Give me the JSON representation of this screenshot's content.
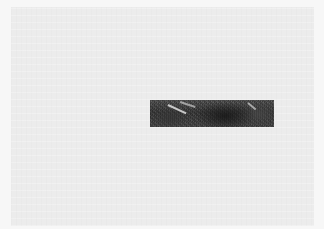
{
  "image": {
    "description": "Light gray page with a single dark grayscale textured photo strip",
    "colors": {
      "frame": "#f7f7f7",
      "background": "#ececec",
      "strip_base": "#454545"
    },
    "strip": {
      "x": 139,
      "y": 93,
      "width": 124,
      "height": 27
    }
  }
}
